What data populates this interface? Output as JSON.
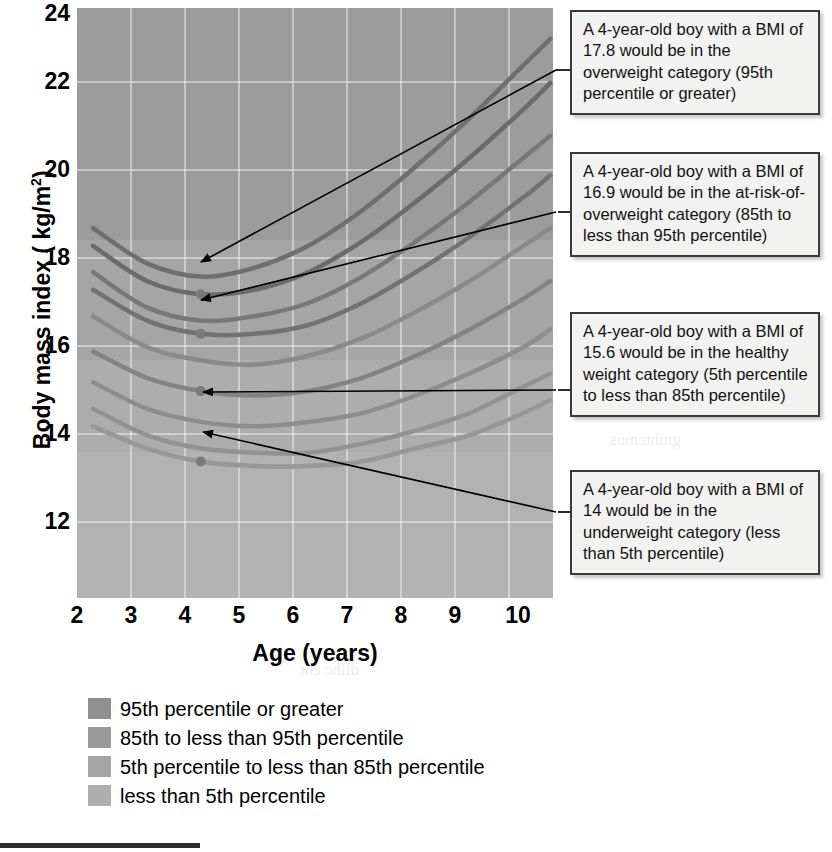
{
  "chart_data": {
    "type": "line",
    "title": "",
    "xlabel": "Age (years)",
    "ylabel": "Body mass index ( kg/m",
    "ylabel_sup": "2",
    "ylabel_suffix": ")",
    "xlim": [
      1.7,
      10.55
    ],
    "ylim": [
      10.9,
      24.3
    ],
    "xticks": [
      2,
      3,
      4,
      5,
      6,
      7,
      8,
      9,
      10
    ],
    "yticks": [
      24,
      22,
      20,
      18,
      16,
      14,
      12
    ],
    "grid": true,
    "legend_position": "below-plot-left",
    "series": [
      {
        "name": "97th percentile",
        "color": "#6f6f6f",
        "x": [
          2,
          3,
          4,
          5,
          6,
          7,
          8,
          9,
          10,
          10.5
        ],
        "y": [
          19.3,
          18.5,
          18.2,
          18.4,
          18.9,
          19.7,
          20.7,
          21.8,
          23.0,
          23.6
        ]
      },
      {
        "name": "95th percentile",
        "color": "#6b6b6b",
        "x": [
          2,
          3,
          4,
          5,
          6,
          7,
          8,
          9,
          10,
          10.5
        ],
        "y": [
          18.9,
          18.1,
          17.8,
          17.9,
          18.3,
          19.0,
          19.9,
          20.9,
          22.0,
          22.6
        ]
      },
      {
        "name": "90th percentile",
        "color": "#787878",
        "x": [
          2,
          3,
          4,
          5,
          6,
          7,
          8,
          9,
          10,
          10.5
        ],
        "y": [
          18.3,
          17.5,
          17.2,
          17.3,
          17.6,
          18.2,
          19.0,
          19.9,
          20.9,
          21.4
        ]
      },
      {
        "name": "85th percentile",
        "color": "#727272",
        "x": [
          2,
          3,
          4,
          5,
          6,
          7,
          8,
          9,
          10,
          10.5
        ],
        "y": [
          17.9,
          17.2,
          16.9,
          16.9,
          17.1,
          17.6,
          18.3,
          19.1,
          20.0,
          20.5
        ]
      },
      {
        "name": "75th percentile",
        "color": "#8a8a8a",
        "x": [
          2,
          3,
          4,
          5,
          6,
          7,
          8,
          9,
          10,
          10.5
        ],
        "y": [
          17.3,
          16.6,
          16.3,
          16.2,
          16.4,
          16.8,
          17.4,
          18.1,
          18.9,
          19.3
        ]
      },
      {
        "name": "50th percentile",
        "color": "#838383",
        "x": [
          2,
          3,
          4,
          5,
          6,
          7,
          8,
          9,
          10,
          10.5
        ],
        "y": [
          16.5,
          15.9,
          15.6,
          15.5,
          15.6,
          15.9,
          16.4,
          17.0,
          17.7,
          18.1
        ]
      },
      {
        "name": "25th percentile",
        "color": "#8d8d8d",
        "x": [
          2,
          3,
          4,
          5,
          6,
          7,
          8,
          9,
          10,
          10.5
        ],
        "y": [
          15.8,
          15.2,
          14.9,
          14.8,
          14.9,
          15.1,
          15.5,
          16.0,
          16.6,
          17.0
        ]
      },
      {
        "name": "10th percentile",
        "color": "#929292",
        "x": [
          2,
          3,
          4,
          5,
          6,
          7,
          8,
          9,
          10,
          10.5
        ],
        "y": [
          15.2,
          14.6,
          14.3,
          14.2,
          14.2,
          14.4,
          14.7,
          15.1,
          15.7,
          16.0
        ]
      },
      {
        "name": "5th percentile",
        "color": "#979797",
        "x": [
          2,
          3,
          4,
          5,
          6,
          7,
          8,
          9,
          10,
          10.5
        ],
        "y": [
          14.8,
          14.3,
          14.0,
          13.9,
          13.9,
          14.0,
          14.3,
          14.6,
          15.1,
          15.4
        ]
      }
    ],
    "markers": [
      {
        "label": "17.8",
        "x": 4,
        "y": 17.8
      },
      {
        "label": "16.9",
        "x": 4,
        "y": 16.9
      },
      {
        "label": "15.6",
        "x": 4,
        "y": 15.6
      },
      {
        "label": "14",
        "x": 4,
        "y": 14.0
      }
    ],
    "bands": [
      {
        "name": "95th percentile or greater",
        "color": "#9a9a9a"
      },
      {
        "name": "85th to less than 95th percentile",
        "color": "#a3a3a3"
      },
      {
        "name": "5th percentile to less than 85th percentile",
        "color": "#ababab"
      },
      {
        "name": "less than 5th percentile",
        "color": "#b2b2b2"
      }
    ]
  },
  "axes": {
    "y_title_main": "Body mass index ( kg/m",
    "y_title_sup": "2",
    "y_title_end": ")",
    "x_title": "Age (years)",
    "yticks": [
      "24",
      "22",
      "20",
      "18",
      "16",
      "14",
      "12"
    ],
    "xticks": [
      "2",
      "3",
      "4",
      "5",
      "6",
      "7",
      "8",
      "9",
      "10"
    ]
  },
  "annotations": [
    {
      "id": "overweight",
      "text": "A 4-year-old boy with a BMI of 17.8 would be in the overweight category (95th percentile or greater)"
    },
    {
      "id": "at-risk-of-overweight",
      "text": "A 4-year-old boy with a BMI of 16.9 would be in the at-risk-of-overweight category (85th to less than 95th percentile)"
    },
    {
      "id": "healthy-weight",
      "text": "A 4-year-old boy with a BMI of 15.6 would be in the healthy weight category (5th percentile to less than 85th percentile)"
    },
    {
      "id": "underweight",
      "text": "A 4-year-old boy with a BMI of 14 would be in the underweight category (less than 5th percentile)"
    }
  ],
  "legend": {
    "items": [
      {
        "label": "95th percentile or greater",
        "color": "#8f8f8f"
      },
      {
        "label": "85th to less than 95th percentile",
        "color": "#9a9a9a"
      },
      {
        "label": "5th percentile to less than 85th percentile",
        "color": "#a4a4a4"
      },
      {
        "label": "less than 5th percentile",
        "color": "#aeaeae"
      }
    ]
  }
}
